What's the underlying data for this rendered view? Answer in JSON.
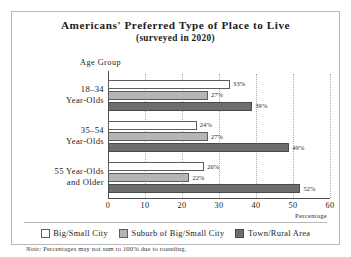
{
  "chart_data": {
    "type": "bar",
    "orientation": "horizontal",
    "title": "Americans' Preferred Type of Place to Live",
    "subtitle": "(surveyed in 2020)",
    "xlabel": "Percentage",
    "ylabel": "Age Group",
    "xlim": [
      0,
      60
    ],
    "xticks": [
      0,
      10,
      20,
      30,
      40,
      50,
      60
    ],
    "xtick_labels": [
      "0",
      "10",
      "20",
      "30",
      "40",
      "50",
      "60"
    ],
    "grid": "vertical-dotted",
    "legend_position": "bottom",
    "categories": [
      "18–34\nYear-Olds",
      "35–54\nYear-Olds",
      "55 Year-Olds\nand Older"
    ],
    "category_lines": [
      [
        "18–34",
        "Year-Olds"
      ],
      [
        "35–54",
        "Year-Olds"
      ],
      [
        "55 Year-Olds",
        "and Older"
      ]
    ],
    "series": [
      {
        "name": "Big/Small City",
        "color": "#ffffff",
        "values": [
          33,
          24,
          26
        ]
      },
      {
        "name": "Suburb of Big/Small City",
        "color": "#b5b5b5",
        "values": [
          27,
          27,
          22
        ]
      },
      {
        "name": "Town/Rural Area",
        "color": "#6e6e6e",
        "values": [
          39,
          49,
          52
        ]
      }
    ],
    "value_labels": [
      [
        "33%",
        "27%",
        "39%"
      ],
      [
        "24%",
        "27%",
        "49%"
      ],
      [
        "26%",
        "22%",
        "52%"
      ]
    ],
    "note_tag": "Note:",
    "note_text": " Percentages may not sum to 100% due to rounding."
  }
}
